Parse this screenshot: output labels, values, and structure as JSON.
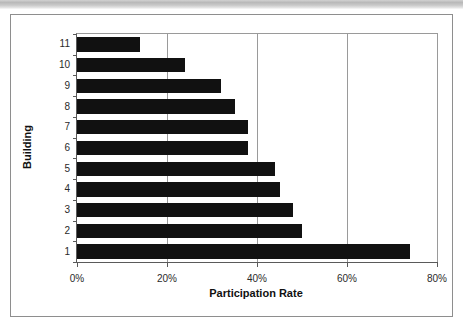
{
  "chart_data": {
    "type": "bar",
    "orientation": "horizontal",
    "title": "",
    "xlabel": "Participation Rate",
    "ylabel": "Building",
    "categories": [
      "1",
      "2",
      "3",
      "4",
      "5",
      "6",
      "7",
      "8",
      "9",
      "10",
      "11"
    ],
    "values": [
      74,
      50,
      48,
      45,
      44,
      38,
      38,
      35,
      32,
      24,
      14
    ],
    "series": [
      {
        "name": "Participation Rate",
        "values": [
          74,
          50,
          48,
          45,
          44,
          38,
          38,
          35,
          32,
          24,
          14
        ]
      }
    ],
    "xlim": [
      0,
      80
    ],
    "ylim": null,
    "x_tick_labels": [
      "0%",
      "20%",
      "40%",
      "60%",
      "80%"
    ],
    "x_tick_values": [
      0,
      20,
      40,
      60,
      80
    ],
    "y_tick_labels": [
      "11",
      "10",
      "9",
      "8",
      "7",
      "6",
      "5",
      "4",
      "3",
      "2",
      "1"
    ],
    "grid": "vertical",
    "legend": null,
    "bar_color": "#111111",
    "axis_color": "#5a5a5a",
    "gridline_color": "#9a9a9a",
    "plot_background": "#ffffff",
    "annotations": []
  },
  "rows": [
    {
      "label": "11",
      "value": 14
    },
    {
      "label": "10",
      "value": 24
    },
    {
      "label": "9",
      "value": 32
    },
    {
      "label": "8",
      "value": 35
    },
    {
      "label": "7",
      "value": 38
    },
    {
      "label": "6",
      "value": 38
    },
    {
      "label": "5",
      "value": 44
    },
    {
      "label": "4",
      "value": 45
    },
    {
      "label": "3",
      "value": 48
    },
    {
      "label": "2",
      "value": 50
    },
    {
      "label": "1",
      "value": 74
    }
  ],
  "x_ticks": [
    {
      "label": "0%",
      "value": 0
    },
    {
      "label": "20%",
      "value": 20
    },
    {
      "label": "40%",
      "value": 40
    },
    {
      "label": "60%",
      "value": 60
    },
    {
      "label": "80%",
      "value": 80
    }
  ]
}
